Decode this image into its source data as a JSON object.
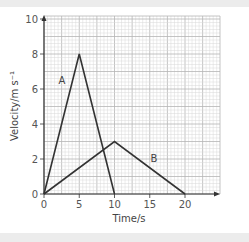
{
  "chart_data": {
    "type": "line",
    "title": "",
    "xlabel": "Time/s",
    "ylabel": "Velocity/m s⁻¹",
    "xlim": [
      0,
      25
    ],
    "ylim": [
      0,
      10
    ],
    "xticks": [
      0,
      5,
      10,
      15,
      20
    ],
    "yticks": [
      0,
      2,
      4,
      6,
      8,
      10
    ],
    "xtick_labels": [
      "0",
      "5",
      "10",
      "15",
      "20"
    ],
    "ytick_labels": [
      "0",
      "2",
      "4",
      "6",
      "8",
      "10"
    ],
    "grid": true,
    "legend": "inline labels",
    "series": [
      {
        "name": "A",
        "x": [
          0,
          5,
          10
        ],
        "y": [
          0,
          8,
          0
        ]
      },
      {
        "name": "B",
        "x": [
          0,
          10,
          20
        ],
        "y": [
          0,
          3,
          0
        ]
      }
    ]
  },
  "colors": {
    "line": "#333333",
    "grid_minor": "#d9d9d9",
    "grid_major": "#b5b5b5",
    "axis": "#333333",
    "band": "#ececec"
  }
}
